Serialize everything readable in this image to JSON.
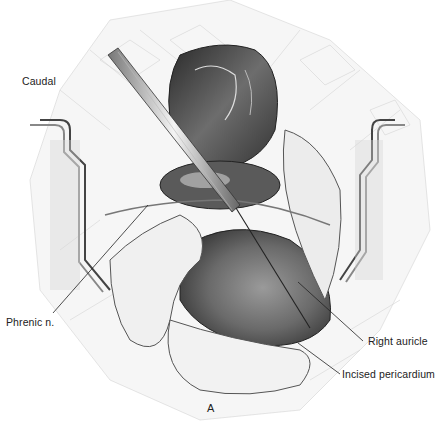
{
  "figure": {
    "panel_letter": "A",
    "orientation_label": "Caudal",
    "labels": [
      {
        "id": "phrenic",
        "text": "Phrenic n."
      },
      {
        "id": "right-auricle",
        "text": "Right auricle"
      },
      {
        "id": "incised-pericardium",
        "text": "Incised pericardium"
      }
    ]
  },
  "colors": {
    "background": "#ffffff",
    "ink": "#222222",
    "dark_tissue": "#3a3a3a",
    "mid_tissue": "#8a8a8a",
    "light_tissue": "#e6e6e6"
  }
}
